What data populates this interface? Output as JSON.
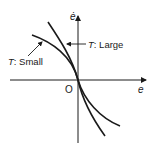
{
  "diagram": {
    "axes": {
      "x_label": "e",
      "y_label": "ė",
      "origin_label": "O"
    },
    "curves": [
      {
        "id": "large",
        "label_var": "T",
        "label_sep": ": ",
        "label_value": "Large",
        "description": "steeper curve through origin"
      },
      {
        "id": "small",
        "label_var": "T",
        "label_sep": ": ",
        "label_value": "Small",
        "description": "flatter curve through origin"
      }
    ],
    "colors": {
      "stroke": "#1a1a1a",
      "background": "#ffffff"
    }
  }
}
